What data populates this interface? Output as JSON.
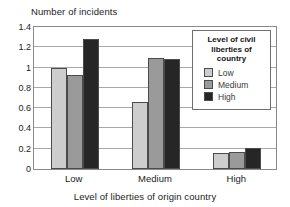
{
  "chart_data": {
    "type": "bar",
    "title": "",
    "xlabel": "Level of liberties of origin country",
    "ylabel": "Number of incidents",
    "categories": [
      "Low",
      "Medium",
      "High"
    ],
    "series": [
      {
        "name": "Low",
        "color": "#cdcdcd",
        "values": [
          1.0,
          0.66,
          0.16
        ]
      },
      {
        "name": "Medium",
        "color": "#9a9a9a",
        "values": [
          0.93,
          1.09,
          0.165
        ]
      },
      {
        "name": "High",
        "color": "#262626",
        "values": [
          1.28,
          1.08,
          0.21
        ]
      }
    ],
    "ylim": [
      0,
      1.4
    ],
    "yticks": [
      "0",
      "0.2",
      "0.4",
      "0.6",
      "0.8",
      "1",
      "1.2",
      "1.4"
    ],
    "ytick_values": [
      0,
      0.2,
      0.4,
      0.6,
      0.8,
      1.0,
      1.2,
      1.4
    ],
    "grid": true,
    "legend": {
      "position": "top-right-inside",
      "title": "Level of civil liberties of country",
      "title_line1": "Level of civil",
      "title_line2": "liberties of country",
      "entries": [
        "Low",
        "Medium",
        "High"
      ]
    }
  }
}
